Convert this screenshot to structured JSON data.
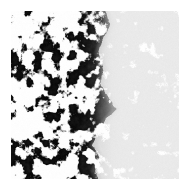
{
  "figure": {
    "title": "",
    "caption": "",
    "background_color": "#ffffff",
    "canvas": {
      "width": 189,
      "height": 194
    },
    "field": {
      "x": 11,
      "y": 11,
      "width": 168,
      "height": 168
    }
  },
  "chart_data": {
    "type": "heatmap",
    "title": "",
    "subtitle": "",
    "xlabel": "",
    "ylabel": "",
    "grid": false,
    "legend": null,
    "colors": {
      "background": "#ffffff",
      "dense_ink": "#000000",
      "faint_ink": "#b4b4b4"
    },
    "regions": [
      {
        "name": "dense-region",
        "x_fraction_range": [
          0.0,
          0.58
        ],
        "mean_ink_coverage": 0.42,
        "contrast": "high",
        "ink_color": "#000000"
      },
      {
        "name": "faint-region",
        "x_fraction_range": [
          0.58,
          1.0
        ],
        "mean_ink_coverage": 0.12,
        "contrast": "low",
        "ink_color": "#bfbfbf"
      }
    ],
    "x": [
      0.0,
      0.1,
      0.2,
      0.3,
      0.4,
      0.45,
      0.5,
      0.55,
      0.6,
      0.65,
      0.7,
      0.8,
      0.9,
      1.0
    ],
    "series": [
      {
        "name": "ink-density-profile",
        "values": [
          0.46,
          0.45,
          0.44,
          0.43,
          0.42,
          0.4,
          0.36,
          0.28,
          0.16,
          0.12,
          0.11,
          0.1,
          0.1,
          0.1
        ]
      },
      {
        "name": "contrast-profile",
        "values": [
          1.0,
          1.0,
          1.0,
          1.0,
          0.98,
          0.95,
          0.85,
          0.6,
          0.3,
          0.22,
          0.2,
          0.2,
          0.2,
          0.2
        ]
      }
    ],
    "boundary_path": [
      {
        "y_fraction": 0.0,
        "x_fraction": 0.56
      },
      {
        "y_fraction": 0.08,
        "x_fraction": 0.59
      },
      {
        "y_fraction": 0.16,
        "x_fraction": 0.55
      },
      {
        "y_fraction": 0.25,
        "x_fraction": 0.52
      },
      {
        "y_fraction": 0.34,
        "x_fraction": 0.55
      },
      {
        "y_fraction": 0.43,
        "x_fraction": 0.53
      },
      {
        "y_fraction": 0.52,
        "x_fraction": 0.58
      },
      {
        "y_fraction": 0.58,
        "x_fraction": 0.63
      },
      {
        "y_fraction": 0.64,
        "x_fraction": 0.57
      },
      {
        "y_fraction": 0.72,
        "x_fraction": 0.51
      },
      {
        "y_fraction": 0.8,
        "x_fraction": 0.49
      },
      {
        "y_fraction": 0.88,
        "x_fraction": 0.53
      },
      {
        "y_fraction": 0.95,
        "x_fraction": 0.5
      },
      {
        "y_fraction": 1.0,
        "x_fraction": 0.52
      }
    ],
    "noise": {
      "seed": 20240517,
      "octaves": 4,
      "base_cell_px": 9,
      "threshold_dense": 0.5,
      "threshold_faint": 0.58,
      "edge_emphasis": true
    }
  }
}
